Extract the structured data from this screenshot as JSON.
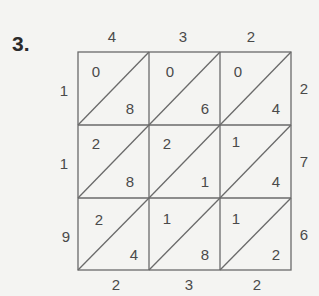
{
  "problem_label": "3.",
  "top_digits": [
    "4",
    "3",
    "2"
  ],
  "right_digits": [
    "2",
    "7",
    "6"
  ],
  "left_digits": [
    "1",
    "1",
    "9"
  ],
  "bottom_digits": [
    "2",
    "3",
    "2"
  ],
  "cells": [
    [
      {
        "tens": "0",
        "ones": "8"
      },
      {
        "tens": "0",
        "ones": "6"
      },
      {
        "tens": "0",
        "ones": "4"
      }
    ],
    [
      {
        "tens": "2",
        "ones": "8"
      },
      {
        "tens": "2",
        "ones": "1"
      },
      {
        "tens": "1",
        "ones": "4"
      }
    ],
    [
      {
        "tens": "2",
        "ones": "4"
      },
      {
        "tens": "1",
        "ones": "8"
      },
      {
        "tens": "1",
        "ones": "2"
      }
    ]
  ],
  "colors": {
    "line": "#6a6a6a",
    "text": "#4a4a4a",
    "background": "#f4f4f2"
  }
}
